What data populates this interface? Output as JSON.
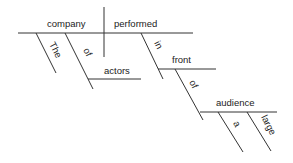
{
  "diagram": {
    "type": "sentence-diagram",
    "subject": "company",
    "verb": "performed",
    "modifiers": {
      "subject_article": "The",
      "subject_preposition": "of",
      "subject_prep_object": "actors",
      "verb_preposition": "in",
      "verb_prep_object": "front",
      "front_preposition": "of",
      "front_prep_object": "audience",
      "audience_article": "a",
      "audience_adjective": "large"
    }
  }
}
